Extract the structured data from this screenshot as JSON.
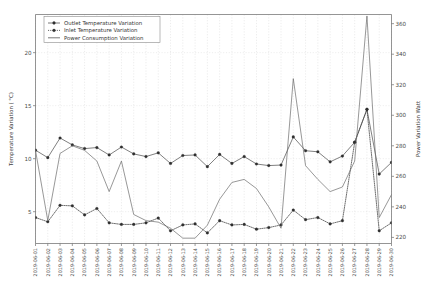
{
  "chart_data": {
    "type": "line",
    "title": "",
    "xlabel": "",
    "ylabel": "Temperature Variation ( °C)",
    "y2label": "Power Variation Watt",
    "grid": true,
    "legend_position": "upper-left",
    "ylim": [
      2.0,
      23.6
    ],
    "y2lim": [
      216.0,
      366.0
    ],
    "yticks": [
      5,
      10,
      15,
      20
    ],
    "ytick_labels": [
      "5",
      "10",
      "15",
      "20"
    ],
    "y2ticks": [
      220,
      240,
      260,
      280,
      300,
      320,
      340,
      360
    ],
    "y2tick_labels": [
      "220",
      "240",
      "260",
      "280",
      "300",
      "320",
      "340",
      "360"
    ],
    "categories": [
      "2019-06-01",
      "2019-06-02",
      "2019-06-03",
      "2019-06-04",
      "2019-06-05",
      "2019-06-06",
      "2019-06-07",
      "2019-06-08",
      "2019-06-09",
      "2019-06-10",
      "2019-06-11",
      "2019-06-12",
      "2019-06-13",
      "2019-06-14",
      "2019-06-15",
      "2019-06-16",
      "2019-06-17",
      "2019-06-18",
      "2019-06-19",
      "2019-06-20",
      "2019-06-21",
      "2019-06-22",
      "2019-06-23",
      "2019-06-24",
      "2019-06-25",
      "2019-06-26",
      "2019-06-27",
      "2019-06-28",
      "2019-06-29",
      "2019-06-30"
    ],
    "series": [
      {
        "name": "Outlet Temperature Variation",
        "axis": "left",
        "style": "solid-marker",
        "values": [
          10.8,
          10.1,
          11.95,
          11.3,
          10.95,
          11.05,
          10.35,
          11.1,
          10.45,
          10.2,
          10.55,
          9.55,
          10.3,
          10.35,
          9.25,
          10.4,
          9.55,
          10.2,
          9.5,
          9.35,
          9.4,
          12.05,
          10.75,
          10.65,
          9.7,
          10.25,
          11.55,
          14.65,
          8.55,
          9.65
        ]
      },
      {
        "name": "Inlet Temperature Variation",
        "axis": "left",
        "style": "dotted-marker",
        "values": [
          4.45,
          4.05,
          5.6,
          5.55,
          4.7,
          5.3,
          3.95,
          3.8,
          3.8,
          3.95,
          4.4,
          3.2,
          3.75,
          3.85,
          3.0,
          4.15,
          3.75,
          3.8,
          3.35,
          3.5,
          3.75,
          5.15,
          4.25,
          4.45,
          3.85,
          4.15,
          11.55,
          14.65,
          3.2,
          3.95
        ]
      },
      {
        "name": "Power Consumption Variation",
        "axis": "right",
        "style": "plain",
        "unit": "Watt",
        "values": [
          277.0,
          231.0,
          275.0,
          280.0,
          277.0,
          270.0,
          250.0,
          270.0,
          235.0,
          231.0,
          230.0,
          226.0,
          219.5,
          219.5,
          228.0,
          245.0,
          256.0,
          258.0,
          252.0,
          240.0,
          226.0,
          324.0,
          267.0,
          258.0,
          250.0,
          253.0,
          270.0,
          365.0,
          233.0,
          248.0
        ]
      }
    ]
  },
  "legend": {
    "entries": [
      {
        "label": "Outlet Temperature Variation"
      },
      {
        "label": "Inlet Temperature Variation"
      },
      {
        "label": "Power Consumption Variation"
      }
    ]
  }
}
